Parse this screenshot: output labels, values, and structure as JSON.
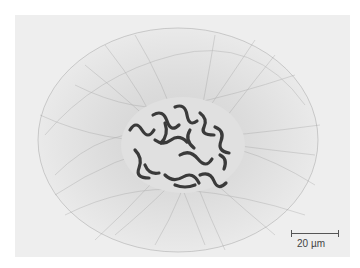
{
  "image": {
    "subject": "cell nucleus with chromosomes surrounded by fibrous network",
    "colors": {
      "page_background": "#ffffff",
      "photo_background": "#eeeeee",
      "fibers": "#9a9a9a",
      "nucleus_fill": "#e2e2e2",
      "chromosomes": "#3a3a3a"
    }
  },
  "scale_bar": {
    "label": "20 µm"
  }
}
